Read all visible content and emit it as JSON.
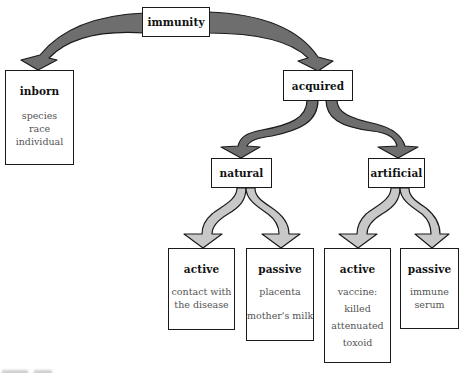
{
  "diagram": {
    "type": "tree",
    "colors": {
      "primary_arrow": "#6e6e6e",
      "secondary_arrow": "#c8c8c8",
      "box_border": "#1a1a1a",
      "title_text": "#111111",
      "item_text": "#555555"
    },
    "root": {
      "label": "immunity"
    },
    "level1": {
      "inborn": {
        "label": "inborn",
        "items": [
          "species",
          "race",
          "individual"
        ]
      },
      "acquired": {
        "label": "acquired"
      }
    },
    "level2": {
      "natural": {
        "label": "natural"
      },
      "artificial": {
        "label": "artificial"
      }
    },
    "level3": {
      "natural_active": {
        "label": "active",
        "items": [
          "contact with",
          "the disease"
        ]
      },
      "natural_passive": {
        "label": "passive",
        "items": [
          "placenta",
          "mother's milk"
        ]
      },
      "artificial_active": {
        "label": "active",
        "items": [
          "vaccine:",
          "killed",
          "attenuated",
          "toxoid"
        ]
      },
      "artificial_passive": {
        "label": "passive",
        "items": [
          "immune",
          "serum"
        ]
      }
    },
    "edges": [
      {
        "from": "immunity",
        "to": "inborn",
        "style": "dark"
      },
      {
        "from": "immunity",
        "to": "acquired",
        "style": "dark"
      },
      {
        "from": "acquired",
        "to": "natural",
        "style": "dark"
      },
      {
        "from": "acquired",
        "to": "artificial",
        "style": "dark"
      },
      {
        "from": "natural",
        "to": "natural_active",
        "style": "light"
      },
      {
        "from": "natural",
        "to": "natural_passive",
        "style": "light"
      },
      {
        "from": "artificial",
        "to": "artificial_active",
        "style": "light"
      },
      {
        "from": "artificial",
        "to": "artificial_passive",
        "style": "light"
      }
    ]
  }
}
